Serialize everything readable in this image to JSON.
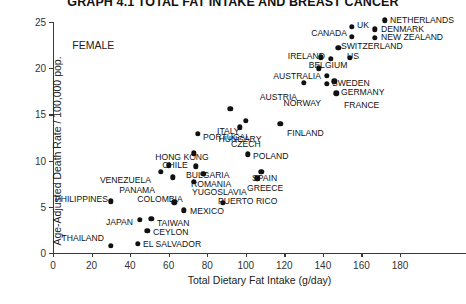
{
  "chart_data": {
    "type": "scatter",
    "title": "GRAPH 4.1 TOTAL FAT INTAKE AND BREAST CANCER",
    "xlabel": "Total Dietary Fat Intake (g/day)",
    "ylabel": "Age-Adjusted Death Rate / 100,000 pop.",
    "xlim": [
      0,
      180
    ],
    "ylim": [
      0,
      25
    ],
    "xticks": [
      0,
      20,
      40,
      60,
      80,
      100,
      120,
      140,
      160,
      180
    ],
    "yticks": [
      0,
      5,
      10,
      15,
      20,
      25
    ],
    "grid": false,
    "legend": "none",
    "annotations": [
      {
        "text": "FEMALE",
        "x": 10,
        "y": 23.2
      }
    ],
    "points": [
      {
        "label": "NETHERLANDS",
        "x": 172,
        "y": 25.2,
        "lx": 390,
        "ly": 20,
        "side": "right"
      },
      {
        "label": "UK",
        "x": 155,
        "y": 24.5,
        "lx": 357,
        "ly": 25,
        "side": "right"
      },
      {
        "label": "DENMARK",
        "x": 167,
        "y": 24.2,
        "lx": 381,
        "ly": 29,
        "side": "right"
      },
      {
        "label": "CANADA",
        "x": 155,
        "y": 23.4,
        "lx": 347,
        "ly": 33,
        "side": "left"
      },
      {
        "label": "NEW ZEALAND",
        "x": 167,
        "y": 23.3,
        "lx": 381,
        "ly": 37,
        "side": "right"
      },
      {
        "label": "SWITZERLAND",
        "x": 148,
        "y": 22.2,
        "lx": 341,
        "ly": 46,
        "side": "right"
      },
      {
        "label": "IRELAND",
        "x": 139,
        "y": 21.2,
        "lx": 325,
        "ly": 56,
        "side": "left"
      },
      {
        "label": "US",
        "x": 154,
        "y": 21.1,
        "lx": 347,
        "ly": 56,
        "side": "right"
      },
      {
        "label": "BELGIUM",
        "x": 144,
        "y": 21.0,
        "lx": 328,
        "ly": 65,
        "side": "center"
      },
      {
        "label": "AUSTRALIA",
        "x": 138,
        "y": 20.0,
        "lx": 321,
        "ly": 76,
        "side": "left"
      },
      {
        "label": "SWEDEN",
        "x": 142,
        "y": 19.2,
        "lx": 332,
        "ly": 83,
        "side": "right"
      },
      {
        "label": "AUSTRIA",
        "x": 130,
        "y": 18.4,
        "lx": 297,
        "ly": 97,
        "side": "left"
      },
      {
        "label": "GERMANY",
        "x": 146,
        "y": 18.6,
        "lx": 341,
        "ly": 92,
        "side": "right"
      },
      {
        "label": "NORWAY",
        "x": 142,
        "y": 18.3,
        "lx": 321,
        "ly": 103,
        "side": "left"
      },
      {
        "label": "FRANCE",
        "x": 147,
        "y": 17.3,
        "lx": 344,
        "ly": 105,
        "side": "right"
      },
      {
        "label": "ITALY",
        "x": 92,
        "y": 15.6,
        "lx": 217,
        "ly": 131,
        "side": "right"
      },
      {
        "label": "CZECH",
        "x": 100,
        "y": 14.3,
        "lx": 231,
        "ly": 144,
        "side": "right"
      },
      {
        "label": "FINLAND",
        "x": 118,
        "y": 14.0,
        "lx": 287,
        "ly": 133,
        "side": "right"
      },
      {
        "label": "HUNGARY",
        "x": 97,
        "y": 13.6,
        "lx": 240,
        "ly": 139,
        "side": "center"
      },
      {
        "label": "PORTUGAL",
        "x": 75,
        "y": 12.9,
        "lx": 203,
        "ly": 137,
        "side": "right"
      },
      {
        "label": "HONG KONG",
        "x": 73,
        "y": 10.8,
        "lx": 182,
        "ly": 157,
        "side": "center"
      },
      {
        "label": "POLAND",
        "x": 101,
        "y": 10.7,
        "lx": 253,
        "ly": 156,
        "side": "right"
      },
      {
        "label": "CHILE",
        "x": 60,
        "y": 9.5,
        "lx": 175,
        "ly": 165,
        "side": "center"
      },
      {
        "label": "BULGARIA",
        "x": 74,
        "y": 9.4,
        "lx": 186,
        "ly": 175,
        "side": "right"
      },
      {
        "label": "VENEZUELA",
        "x": 56,
        "y": 8.8,
        "lx": 151,
        "ly": 180,
        "side": "left"
      },
      {
        "label": "ROMANIA",
        "x": 78,
        "y": 8.6,
        "lx": 191,
        "ly": 184,
        "side": "right"
      },
      {
        "label": "SPAIN",
        "x": 108,
        "y": 8.8,
        "lx": 252,
        "ly": 178,
        "side": "right"
      },
      {
        "label": "GREECE",
        "x": 106,
        "y": 8.1,
        "lx": 247,
        "ly": 188,
        "side": "right"
      },
      {
        "label": "PANAMA",
        "x": 62,
        "y": 8.2,
        "lx": 155,
        "ly": 190,
        "side": "left"
      },
      {
        "label": "YUGOSLAVIA",
        "x": 73,
        "y": 7.7,
        "lx": 192,
        "ly": 192,
        "side": "right"
      },
      {
        "label": "PHILIPPINES",
        "x": 30,
        "y": 5.6,
        "lx": 108,
        "ly": 199,
        "side": "left"
      },
      {
        "label": "COLOMBIA",
        "x": 63,
        "y": 5.5,
        "lx": 160,
        "ly": 199,
        "side": "center"
      },
      {
        "label": "PUERTO RICO",
        "x": 88,
        "y": 5.4,
        "lx": 218,
        "ly": 201,
        "side": "right"
      },
      {
        "label": "MEXICO",
        "x": 68,
        "y": 4.6,
        "lx": 190,
        "ly": 211,
        "side": "right"
      },
      {
        "label": "JAPAN",
        "x": 45,
        "y": 3.6,
        "lx": 133,
        "ly": 222,
        "side": "left"
      },
      {
        "label": "TAIWAN",
        "x": 51,
        "y": 3.7,
        "lx": 157,
        "ly": 223,
        "side": "right"
      },
      {
        "label": "CEYLON",
        "x": 49,
        "y": 2.4,
        "lx": 153,
        "ly": 232,
        "side": "right"
      },
      {
        "label": "EL SALVADOR",
        "x": 44,
        "y": 1.0,
        "lx": 143,
        "ly": 244,
        "side": "right"
      },
      {
        "label": "THAILAND",
        "x": 30,
        "y": 0.8,
        "lx": 104,
        "ly": 238,
        "side": "left"
      }
    ]
  }
}
